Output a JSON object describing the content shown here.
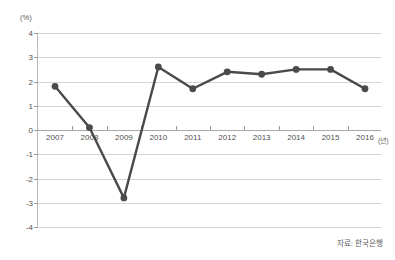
{
  "chart_data": {
    "type": "line",
    "title": "",
    "subtitle": "",
    "xlabel": "(년)",
    "ylabel": "(%)",
    "unit_top_label": "(%)",
    "categories": [
      "2007",
      "2008",
      "2009",
      "2010",
      "2011",
      "2012",
      "2013",
      "2014",
      "2015",
      "2016"
    ],
    "values": [
      1.8,
      0.1,
      -2.8,
      2.6,
      1.7,
      2.4,
      2.3,
      2.5,
      2.5,
      1.7
    ],
    "series": [
      {
        "name": "성장률",
        "values": [
          1.8,
          0.1,
          -2.8,
          2.6,
          1.7,
          2.4,
          2.3,
          2.5,
          2.5,
          1.7
        ]
      }
    ],
    "ylim": [
      -4,
      4
    ],
    "yticks": [
      4,
      3,
      2,
      1,
      0,
      -1,
      -2,
      -3,
      -4
    ],
    "ytick_labels": [
      "4",
      "3",
      "2",
      "1",
      "0",
      "-1",
      "-2",
      "-3",
      "-4"
    ],
    "grid": true,
    "legend": false,
    "legend_position": "none",
    "zero_line": 0,
    "line_color": "#4a4a4a",
    "marker_color": "#4a4a4a",
    "grid_color": "#d4d4d4",
    "axis_color": "#a8a8a8"
  },
  "source": {
    "text": "자료: 한국은행"
  }
}
